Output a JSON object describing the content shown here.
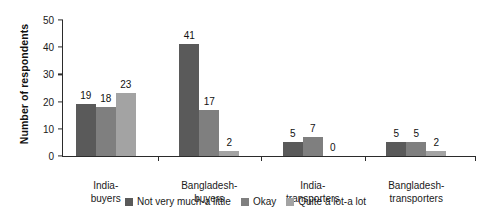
{
  "chart_data": {
    "type": "bar",
    "title": "",
    "xlabel": "",
    "ylabel": "Number of respondents",
    "ylim": [
      0,
      50
    ],
    "yticks": [
      0,
      10,
      20,
      30,
      40,
      50
    ],
    "grid": false,
    "legend_position": "bottom-center",
    "categories": [
      "India-\nbuyers",
      "Bangladesh-\nbuyers",
      "India-\ntransporters",
      "Bangladesh-\ntransporters"
    ],
    "series": [
      {
        "name": "Not very much-a little",
        "color": "#5a5a5a",
        "values": [
          19,
          41,
          5,
          5
        ]
      },
      {
        "name": "Okay",
        "color": "#7f7f7f",
        "values": [
          18,
          17,
          7,
          5
        ]
      },
      {
        "name": "Quite a lot-a lot",
        "color": "#a3a3a3",
        "values": [
          23,
          2,
          0,
          2
        ]
      }
    ]
  },
  "axis": {
    "y_title": "Number of respondents",
    "y_tick_labels": [
      "0",
      "10",
      "20",
      "30",
      "40",
      "50"
    ]
  },
  "legend": {
    "items": [
      {
        "label": "Not very much-a little"
      },
      {
        "label": "Okay"
      },
      {
        "label": "Quite a lot-a lot"
      }
    ]
  },
  "categories": [
    {
      "line1": "India-",
      "line2": "buyers"
    },
    {
      "line1": "Bangladesh-",
      "line2": "buyers"
    },
    {
      "line1": "India-",
      "line2": "transporters"
    },
    {
      "line1": "Bangladesh-",
      "line2": "transporters"
    }
  ]
}
